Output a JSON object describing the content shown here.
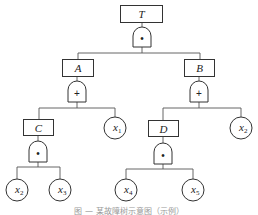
{
  "diagram": {
    "type": "fault-tree",
    "top_event": {
      "label": "T",
      "gate": "AND",
      "gate_symbol": "•"
    },
    "intermediate_events": [
      {
        "label": "A",
        "gate": "OR",
        "gate_symbol": "+"
      },
      {
        "label": "B",
        "gate": "OR",
        "gate_symbol": "+"
      },
      {
        "label": "C",
        "gate": "AND",
        "gate_symbol": "•"
      },
      {
        "label": "D",
        "gate": "AND",
        "gate_symbol": "•"
      }
    ],
    "basic_events": [
      {
        "id": "x1_a",
        "var": "x",
        "sub": "1"
      },
      {
        "id": "x2_c",
        "var": "x",
        "sub": "2"
      },
      {
        "id": "x3_c",
        "var": "x",
        "sub": "3"
      },
      {
        "id": "x2_b",
        "var": "x",
        "sub": "2"
      },
      {
        "id": "x4_d",
        "var": "x",
        "sub": "4"
      },
      {
        "id": "x5_d",
        "var": "x",
        "sub": "5"
      }
    ],
    "edges": [
      [
        "T",
        "A"
      ],
      [
        "T",
        "B"
      ],
      [
        "A",
        "C"
      ],
      [
        "A",
        "x1"
      ],
      [
        "B",
        "D"
      ],
      [
        "B",
        "x2"
      ],
      [
        "C",
        "x2"
      ],
      [
        "C",
        "x3"
      ],
      [
        "D",
        "x4"
      ],
      [
        "D",
        "x5"
      ]
    ],
    "caption": "图 — 某故障树示意图（示例）"
  },
  "labels": {
    "T": "T",
    "A": "A",
    "B": "B",
    "C": "C",
    "D": "D",
    "and": "•",
    "or": "+",
    "x": "x",
    "s1": "1",
    "s2": "2",
    "s3": "3",
    "s4": "4",
    "s5": "5"
  }
}
